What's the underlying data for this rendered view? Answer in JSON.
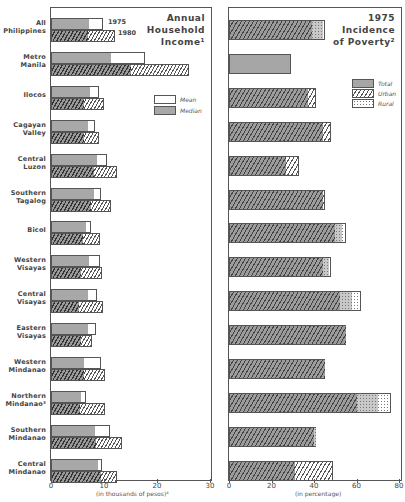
{
  "chart_data": [
    {
      "type": "bar",
      "orientation": "horizontal",
      "title": "Annual Household Income",
      "title_footnote": "1",
      "xlabel": "(in thousands of pesos)",
      "xlabel_footnote": "4",
      "xlim": [
        0,
        30
      ],
      "xticks": [
        "0",
        "10",
        "20",
        "30"
      ],
      "grid": false,
      "legend": {
        "position": "right-middle",
        "entries": [
          "Mean",
          "Median"
        ]
      },
      "year_labels": [
        "1975",
        "1980"
      ],
      "categories": [
        "All Philippines",
        "Metro Manila",
        "Ilocos",
        "Cagayan Valley",
        "Central Luzon",
        "Southern Tagalog",
        "Bicol",
        "Western Visayas",
        "Central Visayas",
        "Eastern Visayas",
        "Western Mindanao",
        "Northern Mindanao",
        "Southern Mindanao",
        "Central Mindanao"
      ],
      "series": [
        {
          "name": "1975 Median",
          "values": [
            7.2,
            11.3,
            7.4,
            7.0,
            8.6,
            8.1,
            6.6,
            7.2,
            6.9,
            7.0,
            6.3,
            5.6,
            8.3,
            8.8
          ]
        },
        {
          "name": "1975 Mean",
          "values": [
            9.8,
            17.7,
            9.1,
            8.3,
            10.5,
            9.5,
            7.6,
            9.3,
            8.6,
            8.5,
            9.5,
            6.6,
            11.2,
            9.6
          ]
        },
        {
          "name": "1980 Median",
          "values": [
            7.0,
            15.1,
            6.2,
            6.3,
            8.2,
            7.5,
            6.0,
            5.7,
            5.2,
            5.6,
            6.3,
            5.5,
            8.5,
            9.4
          ]
        },
        {
          "name": "1980 Mean",
          "values": [
            12.0,
            26.0,
            10.0,
            9.1,
            12.4,
            11.4,
            9.3,
            9.6,
            9.9,
            7.7,
            10.1,
            10.2,
            13.4,
            12.4
          ]
        }
      ]
    },
    {
      "type": "bar",
      "orientation": "horizontal",
      "title": "1975 Incidence of Poverty",
      "title_footnote": "2",
      "xlabel": "(in percentage)",
      "xlim": [
        0,
        80
      ],
      "xticks": [
        "0",
        "20",
        "40",
        "60",
        "80"
      ],
      "grid": false,
      "legend": {
        "position": "right-upper",
        "entries": [
          "Total",
          "Urban",
          "Rural"
        ]
      },
      "categories": [
        "All Philippines",
        "Metro Manila",
        "Ilocos",
        "Cagayan Valley",
        "Central Luzon",
        "Southern Tagalog",
        "Bicol",
        "Western Visayas",
        "Central Visayas",
        "Eastern Visayas",
        "Western Mindanao",
        "Northern Mindanao",
        "Southern Mindanao",
        "Central Mindanao"
      ],
      "series": [
        {
          "name": "Urban",
          "values": [
            39,
            29,
            37,
            44,
            27,
            44,
            50,
            44,
            52,
            55,
            45,
            60,
            40,
            49
          ]
        },
        {
          "name": "Total",
          "values": [
            44,
            29,
            37,
            44,
            27,
            44,
            53,
            47,
            58,
            55,
            45,
            70,
            41,
            31
          ]
        },
        {
          "name": "Rural",
          "values": [
            45,
            29,
            41,
            48,
            33,
            45,
            55,
            48,
            62,
            55,
            45,
            76,
            41,
            31
          ]
        }
      ]
    }
  ],
  "labels": {
    "rows": [
      [
        "All",
        "Philippines"
      ],
      [
        "Metro",
        "Manila"
      ],
      [
        "Ilocos",
        ""
      ],
      [
        "Cagayan",
        "Valley"
      ],
      [
        "Central",
        "Luzon"
      ],
      [
        "Southern",
        "Tagalog"
      ],
      [
        "Bicol",
        ""
      ],
      [
        "Western",
        "Visayas"
      ],
      [
        "Central",
        "Visayas"
      ],
      [
        "Eastern",
        "Visayas"
      ],
      [
        "Western",
        "Mindanao"
      ],
      [
        "Northern",
        "Mindanao³"
      ],
      [
        "Southern",
        "Mindanao"
      ],
      [
        "Central",
        "Mindanao"
      ]
    ],
    "left_title": [
      "Annual",
      "Household",
      "Income¹"
    ],
    "right_title": [
      "1975",
      "Incidence",
      "of Poverty²"
    ],
    "year_1975": "1975",
    "year_1980": "1980",
    "left_legend": {
      "mean": "Mean",
      "median": "Median"
    },
    "right_legend": {
      "total": "Total",
      "urban": "Urban",
      "rural": "Rural"
    },
    "left_xlabel": "(in thousands of pesos)⁴",
    "right_xlabel": "(in percentage)",
    "left_ticks": [
      "0",
      "10",
      "20",
      "30"
    ],
    "right_ticks": [
      "0",
      "20",
      "40",
      "60",
      "80"
    ]
  }
}
